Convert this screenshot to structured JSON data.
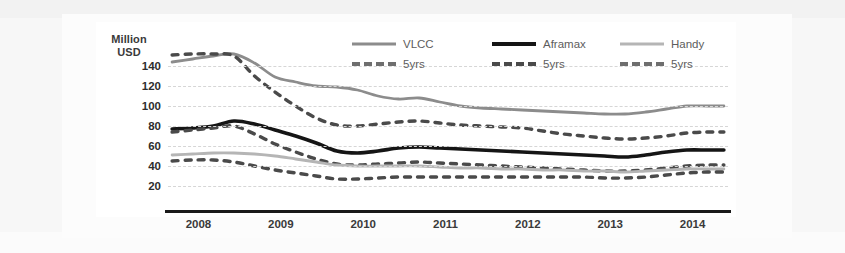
{
  "chart_data": {
    "type": "line",
    "title": "",
    "xlabel": "",
    "ylabel": "Million USD",
    "ylabel_line1": "Million",
    "ylabel_line2": "USD",
    "ylim": [
      0,
      160
    ],
    "yticks": [
      140,
      120,
      100,
      80,
      60,
      40,
      20
    ],
    "xlim": [
      2007.8,
      2014.6
    ],
    "xticks": [
      2008,
      2009,
      2010,
      2011,
      2012,
      2013,
      2014
    ],
    "xtick_labels": [
      "2008",
      "2009",
      "2010",
      "2011",
      "2012",
      "2013",
      "2014"
    ],
    "grid": true,
    "legend_position": "top-right-inside",
    "x": [
      2007.85,
      2008.1,
      2008.35,
      2008.6,
      2008.85,
      2009.1,
      2009.35,
      2009.6,
      2009.85,
      2010.1,
      2010.35,
      2010.6,
      2010.85,
      2011.1,
      2011.35,
      2011.6,
      2011.85,
      2012.1,
      2012.35,
      2012.6,
      2012.85,
      2013.1,
      2013.35,
      2013.6,
      2013.85,
      2014.1,
      2014.35,
      2014.55
    ],
    "series": [
      {
        "name": "VLCC",
        "style": "solid",
        "color": "#8c8c8c",
        "values": [
          144,
          147,
          150,
          152,
          143,
          129,
          124,
          120,
          119,
          116,
          110,
          107,
          108,
          104,
          100,
          98,
          97,
          96,
          95,
          94,
          93,
          92,
          92,
          94,
          97,
          100,
          100,
          100
        ]
      },
      {
        "name": "VLCC 5yrs",
        "style": "dashed",
        "color": "#4a4a4a",
        "values": [
          151,
          152,
          152,
          150,
          130,
          114,
          100,
          88,
          81,
          80,
          82,
          84,
          85,
          83,
          81,
          80,
          79,
          78,
          75,
          72,
          70,
          68,
          67,
          68,
          70,
          73,
          74,
          74
        ]
      },
      {
        "name": "Aframax",
        "style": "solid",
        "color": "#151515",
        "values": [
          77,
          78,
          80,
          85,
          82,
          76,
          70,
          63,
          55,
          53,
          55,
          58,
          59,
          58,
          57,
          56,
          55,
          54,
          53,
          52,
          51,
          50,
          49,
          51,
          54,
          56,
          56,
          56
        ]
      },
      {
        "name": "Aframax 5yrs",
        "style": "dashed",
        "color": "#4a4a4a",
        "values": [
          74,
          76,
          78,
          80,
          72,
          62,
          54,
          47,
          42,
          41,
          42,
          43,
          44,
          43,
          42,
          41,
          40,
          39,
          38,
          37,
          36,
          35,
          35,
          36,
          38,
          40,
          41,
          41
        ]
      },
      {
        "name": "Handy",
        "style": "solid",
        "color": "#b5b5b5",
        "values": [
          51,
          52,
          53,
          53,
          52,
          50,
          47,
          44,
          41,
          40,
          40,
          40,
          40,
          39,
          38,
          38,
          37,
          37,
          36,
          36,
          35,
          35,
          34,
          35,
          36,
          37,
          37,
          37
        ]
      },
      {
        "name": "Handy 5yrs",
        "style": "dashed",
        "color": "#4a4a4a",
        "values": [
          45,
          46,
          46,
          44,
          40,
          36,
          33,
          30,
          27,
          27,
          28,
          29,
          29,
          29,
          29,
          29,
          29,
          29,
          29,
          29,
          29,
          28,
          28,
          29,
          31,
          33,
          34,
          34
        ]
      }
    ],
    "legend": [
      {
        "label": "VLCC",
        "style": "solid",
        "color": "#8c8c8c"
      },
      {
        "label": "Aframax",
        "style": "solid",
        "color": "#151515"
      },
      {
        "label": "Handy",
        "style": "solid",
        "color": "#b5b5b5"
      },
      {
        "label": "5yrs",
        "style": "dashed",
        "color": "#6e6e6e"
      },
      {
        "label": "5yrs",
        "style": "dashed",
        "color": "#4a4a4a"
      },
      {
        "label": "5yrs",
        "style": "dashed",
        "color": "#6e6e6e"
      }
    ]
  }
}
